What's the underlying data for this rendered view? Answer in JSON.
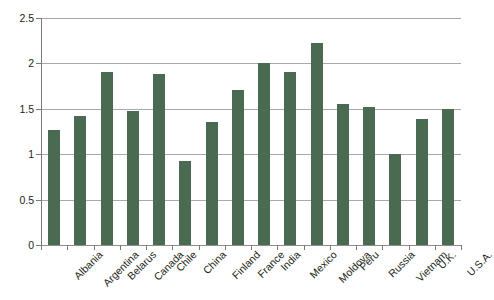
{
  "chart_data": {
    "type": "bar",
    "title": "",
    "subtitle": "",
    "xlabel": "",
    "ylabel": "",
    "ylim": [
      0,
      2.5
    ],
    "ytick_labels": [
      "0",
      "0.5",
      "1",
      "1.5",
      "2",
      "2.5"
    ],
    "ytick_values": [
      0,
      0.5,
      1,
      1.5,
      2,
      2.5
    ],
    "grid": true,
    "legend": null,
    "legend_position": "none",
    "bar_color": "#4a6b52",
    "gridline_color": "#a9a9a9",
    "axis_color": "#7a7a7a",
    "categories": [
      "Albania",
      "Argentina",
      "Belarus",
      "Canada",
      "Chile",
      "China",
      "Finland",
      "France",
      "India",
      "Mexico",
      "Moldova",
      "Peru",
      "Russia",
      "Vietnam",
      "U.K.",
      "U.S.A."
    ],
    "values": [
      1.27,
      1.42,
      1.91,
      1.48,
      1.88,
      0.93,
      1.36,
      1.71,
      2.01,
      1.91,
      2.23,
      1.55,
      1.52,
      1.0,
      1.39,
      1.5
    ]
  }
}
